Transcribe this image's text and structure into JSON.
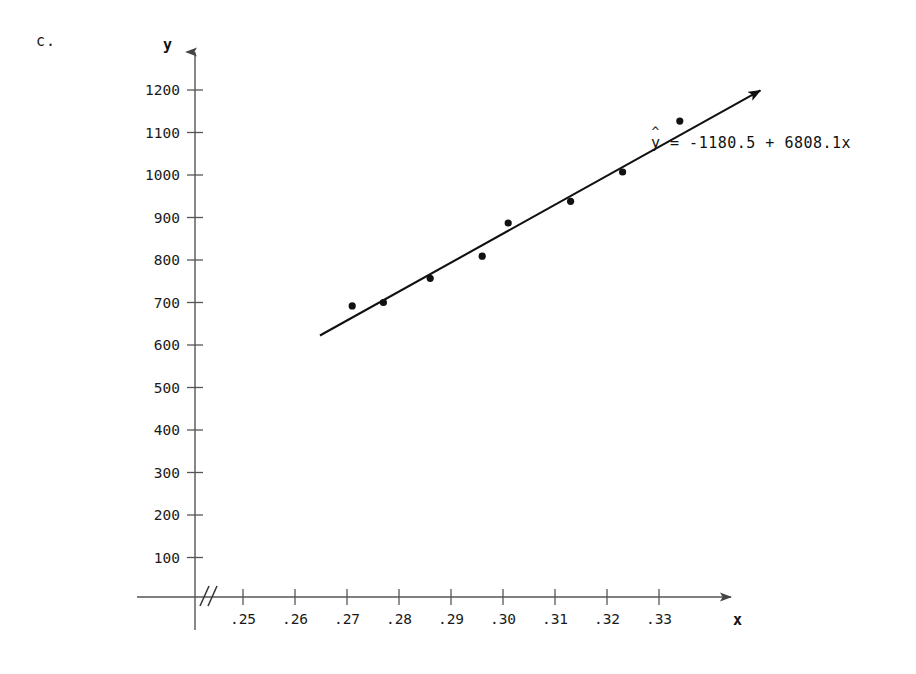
{
  "figure": {
    "part_label": "c.",
    "equation_text": "y = -1180.5 + 6808.1x",
    "equation_lhs": "y",
    "equation_hat": "^",
    "equation_rhs": "= -1180.5 + 6808.1x"
  },
  "axes": {
    "x_axis_label": "x",
    "y_axis_label": "y",
    "x_break_symbol": "//"
  },
  "chart_data": {
    "type": "scatter",
    "title": "",
    "subtitle": "",
    "xlabel": "x",
    "ylabel": "y",
    "grid": false,
    "legend": null,
    "xlim": [
      0.24,
      0.34
    ],
    "ylim": [
      0,
      1250
    ],
    "x_tick_labels": [
      ".25",
      ".26",
      ".27",
      ".28",
      ".29",
      ".30",
      ".31",
      ".32",
      ".33"
    ],
    "x_tick_values": [
      0.25,
      0.26,
      0.27,
      0.28,
      0.29,
      0.3,
      0.31,
      0.32,
      0.33
    ],
    "y_tick_labels": [
      "100",
      "200",
      "300",
      "400",
      "500",
      "600",
      "700",
      "800",
      "900",
      "1000",
      "1100",
      "1200"
    ],
    "y_tick_values": [
      100,
      200,
      300,
      400,
      500,
      600,
      700,
      800,
      900,
      1000,
      1100,
      1200
    ],
    "axis_break_on_x": true,
    "points": [
      {
        "x": 0.271,
        "y": 692
      },
      {
        "x": 0.277,
        "y": 700
      },
      {
        "x": 0.286,
        "y": 757
      },
      {
        "x": 0.296,
        "y": 809
      },
      {
        "x": 0.301,
        "y": 887
      },
      {
        "x": 0.313,
        "y": 938
      },
      {
        "x": 0.323,
        "y": 1007
      },
      {
        "x": 0.334,
        "y": 1127
      }
    ],
    "fit_line": {
      "label": "y = -1180.5 + 6808.1x",
      "intercept": -1180.5,
      "slope": 6808.1,
      "x_start": 0.2648,
      "x_end": 0.3495,
      "arrow_at_end": true
    },
    "annotations": [
      {
        "text": "y = -1180.5 + 6808.1x",
        "x": 0.3175,
        "y": 1070
      }
    ],
    "colors": {
      "point": "#111111",
      "line": "#111111",
      "axis": "#555555",
      "text": "#1a1a1a"
    }
  }
}
